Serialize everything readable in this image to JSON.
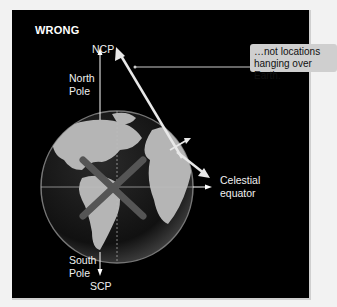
{
  "figure": {
    "title": "WRONG",
    "labels": {
      "ncp": "NCP",
      "north_pole": "North\nPole",
      "south_pole": "South\nPole",
      "scp": "SCP",
      "celestial_equator": "Celestial\nequator"
    },
    "callout": {
      "text": "…not locations\nhanging over Earth."
    },
    "colors": {
      "background": "#000000",
      "frame": "#f2f2f2",
      "callout_bg": "#cfcfcf",
      "text": "#f0f0f0",
      "cross": "#555555",
      "globe_land": "#b8b8b8",
      "globe_ocean": "#1a1a1a"
    },
    "icons": {
      "cross": "x-mark-icon"
    }
  }
}
